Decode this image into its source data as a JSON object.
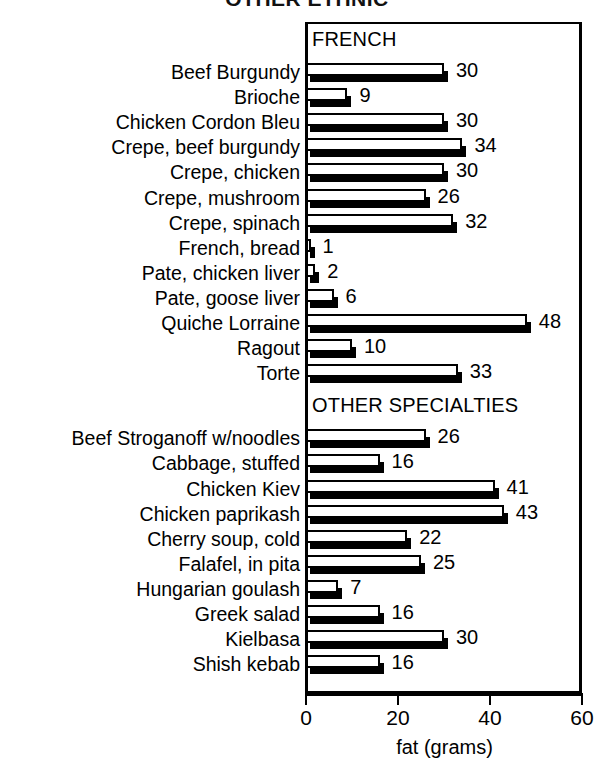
{
  "chart_data": {
    "type": "bar",
    "orientation": "horizontal",
    "title": "OTHER ETHNIC",
    "xlabel": "fat (grams)",
    "ylabel": "",
    "xlim": [
      0,
      60
    ],
    "xticks": [
      0,
      20,
      40,
      60
    ],
    "grid": false,
    "legend": null,
    "style": "3d-horizontal-bars-white-face-black-shadow",
    "groups": [
      {
        "name": "FRENCH",
        "categories": [
          "Beef Burgundy",
          "Brioche",
          "Chicken Cordon Bleu",
          "Crepe, beef burgundy",
          "Crepe, chicken",
          "Crepe, mushroom",
          "Crepe, spinach",
          "French, bread",
          "Pate, chicken liver",
          "Pate, goose liver",
          "Quiche Lorraine",
          "Ragout",
          "Torte"
        ],
        "values": [
          30,
          9,
          30,
          34,
          30,
          26,
          32,
          1,
          2,
          6,
          48,
          10,
          33
        ]
      },
      {
        "name": "OTHER SPECIALTIES",
        "categories": [
          "Beef Stroganoff w/noodles",
          "Cabbage, stuffed",
          "Chicken Kiev",
          "Chicken paprikash",
          "Cherry soup, cold",
          "Falafel, in pita",
          "Hungarian goulash",
          "Greek salad",
          "Kielbasa",
          "Shish kebab"
        ],
        "values": [
          26,
          16,
          41,
          43,
          22,
          25,
          7,
          16,
          30,
          16
        ]
      }
    ]
  },
  "colors": {
    "bar_face": "#ffffff",
    "bar_outline": "#000000",
    "bar_shadow": "#000000",
    "axis": "#000000",
    "background": "#ffffff",
    "text": "#000000"
  }
}
